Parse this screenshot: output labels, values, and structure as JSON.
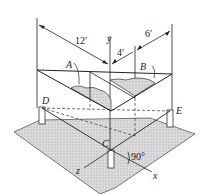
{
  "figure": {
    "type": "isometric structural diagram",
    "dimensions": {
      "overall": "12′",
      "middle": "4′",
      "right": "6′"
    },
    "points": {
      "A": "A",
      "B": "B",
      "C": "C",
      "D": "D",
      "E": "E"
    },
    "axes": {
      "x": "x",
      "y": "y",
      "z": "z"
    },
    "angle": "90°"
  }
}
